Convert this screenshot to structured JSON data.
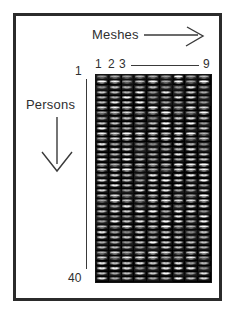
{
  "figure": {
    "border_color": "#2b2b2b",
    "background": "#ffffff"
  },
  "column_axis": {
    "title": "Meshes",
    "arrow": "right-arrow",
    "ticks": [
      "1",
      "2",
      "3",
      "9"
    ],
    "first_index": 1,
    "last_index": 9,
    "count": 9
  },
  "row_axis": {
    "title": "Persons",
    "arrow": "down-arrow",
    "ticks": [
      "1",
      "40"
    ],
    "first_index": 1,
    "last_index": 40,
    "count": 40
  },
  "grid": {
    "columns": 9,
    "rows": 40,
    "total_cells": 360,
    "cell_kind": "face-thumbnail",
    "cell_background": "#262626",
    "grid_background": "#1b1b1b"
  },
  "chart_data": {
    "type": "heatmap",
    "title": "",
    "xlabel": "Meshes",
    "ylabel": "Persons",
    "x": [
      1,
      2,
      3,
      4,
      5,
      6,
      7,
      8,
      9
    ],
    "xtick_labels": [
      "1",
      "2",
      "3",
      "9"
    ],
    "ytick_labels": [
      "1",
      "40"
    ],
    "xlim": [
      1,
      9
    ],
    "ylim": [
      1,
      40
    ],
    "grid": false,
    "legend": "none",
    "rows": 40,
    "columns": 9,
    "cells": 360,
    "annotations": [
      "Meshes",
      "Persons"
    ]
  }
}
